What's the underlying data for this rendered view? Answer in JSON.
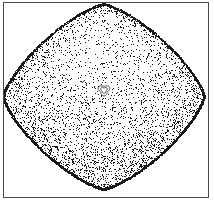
{
  "figure": {
    "title": "",
    "caption": "",
    "background_color": "#ffffff",
    "frame_color": "#4a4a4a",
    "point_color": "#1a1a1a",
    "curve_color": "#2a2a2a"
  },
  "chart_data": {
    "type": "scatter",
    "title": "",
    "subtitle": "",
    "xlabel": "",
    "ylabel": "",
    "xlim": [
      -1,
      1
    ],
    "ylim": [
      -1,
      1
    ],
    "grid": false,
    "legend": null,
    "tick_labels": {
      "x": [],
      "y": []
    },
    "description": "Poincare section / chaotic sea filling a rounded rhombus (diamond) region, with a small closed invariant curve (KAM island) near the centre.",
    "point_count": 9000,
    "point_size_px": 1,
    "marker": "pixel",
    "regions": [
      {
        "name": "chaotic-sea",
        "shape": "rounded-rhombus",
        "center_px": [
          104,
          97
        ],
        "half_width_px": 101,
        "half_height_px": 93,
        "corner_roundness": 0.3,
        "superellipse_exponent": 1.35,
        "density_top": 0.18,
        "density_bottom": 1.0,
        "edge_enhancement": 1.0
      },
      {
        "name": "kam-island",
        "shape": "closed-curve",
        "center_px": [
          104,
          90
        ],
        "radius_px": 5.2,
        "lobes": 3,
        "rings": 2,
        "filled": false
      }
    ],
    "annotations": []
  },
  "axes": {
    "visible_frame": true,
    "ticks_visible": false,
    "tick_marks": []
  }
}
